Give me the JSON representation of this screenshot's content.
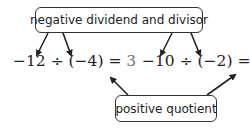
{
  "top_label": "negative dividend and divisor",
  "bottom_label": "positive quotient",
  "equations": [
    {
      "dividend": "−12",
      "op": " ÷ ",
      "divisor": "(−4)",
      "eq": " = ",
      "result": "3"
    },
    {
      "dividend": "−10",
      "op": " ÷ ",
      "divisor": "(−2)",
      "eq": " = ",
      "result": "5"
    }
  ],
  "colors": {
    "text": "#222222",
    "result": "#777777",
    "border": "#333333"
  }
}
